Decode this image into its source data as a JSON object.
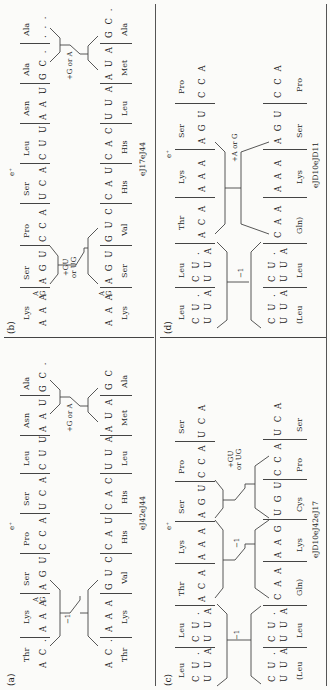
{
  "figure": {
    "panels": [
      {
        "id": "a",
        "label": "(a)",
        "e_plus": "e⁺",
        "strain": "eJ42eJ44",
        "wt_amino": [
          "Thr",
          "Lys",
          "Ser",
          "Pro",
          "Ser",
          "Leu",
          "Asn",
          "Ala"
        ],
        "wt_codons": [
          "A C .",
          "A A A/G",
          "A G U",
          "C C A",
          "U C A",
          "C U U",
          "A A U",
          "G C ."
        ],
        "mut_amino": [
          "Thr",
          "Lys",
          "Val",
          "His",
          "His",
          "Leu",
          "Met",
          "Ala"
        ],
        "mut_codons": [
          "A C .",
          "A A A",
          "G U C",
          "C A U",
          "C A C",
          "U U A",
          "A U A/G",
          "G C"
        ],
        "shift1": "−1",
        "shift2": "+G or A"
      },
      {
        "id": "b",
        "label": "(b)",
        "e_plus": "e⁺",
        "strain": "eJ17eJ44",
        "wt_amino": [
          "Lys",
          "Ser",
          "Pro",
          "Ser",
          "Leu",
          "Asn",
          "Ala",
          "Ala"
        ],
        "wt_codons": [
          "A A A/G",
          "A G U",
          "C C A",
          "U C A",
          "C U U",
          "A A U",
          "G C .",
          ". . ."
        ],
        "mut_amino": [
          "Lys",
          "Ser",
          "Val",
          "His",
          "His",
          "Leu",
          "Met",
          "Ala"
        ],
        "mut_codons": [
          "A A A/G",
          "A G U",
          "G U C",
          "C A U",
          "C A C",
          "U U A",
          "A U A/G",
          "G C ."
        ],
        "shift1": "+GU or UG",
        "shift2": "+G or A"
      },
      {
        "id": "c",
        "label": "(c)",
        "e_plus": "e⁺",
        "strain": "eJD10eJ42eJ17",
        "wt_amino": [
          "Leu",
          "Leu",
          "Thr",
          "Lys",
          "Ser",
          "Pro",
          "Ser"
        ],
        "wt_codons": [
          "C U .  U U A/G",
          "C U .  U U A/G",
          "A C A/G",
          "A A A/G",
          "A G U",
          "C C A",
          "U C A"
        ],
        "mut_amino": [
          "(Leu",
          "Leu",
          "Gln)",
          "Lys",
          "Cys",
          "Pro",
          "Ser"
        ],
        "mut_codons": [
          "C U .  U U A/G",
          "C U .  U U A/G",
          "C A A",
          "A A G",
          "U G U",
          "C C A",
          "U C A"
        ],
        "shift1": "−1",
        "shift2": "−1",
        "shift3": "+GU or UG"
      },
      {
        "id": "d",
        "label": "(d)",
        "e_plus": "e⁺",
        "strain": "eJD10eJD11",
        "wt_amino": [
          "Leu",
          "Leu",
          "Thr",
          "Lys",
          "Ser",
          "Pro"
        ],
        "wt_codons": [
          "C U .  U U A/G",
          "C U .  U U A/G",
          "A C A/G",
          "A A A/G",
          "A G U",
          "C C A"
        ],
        "mut_amino": [
          "(Leu",
          "Leu",
          "Gln)",
          "Lys",
          "Ser",
          "Pro"
        ],
        "mut_codons": [
          "C U .  U U A/G",
          "C U .  U U A/G",
          "C A A/G",
          "A A A/G",
          "A G U",
          "C C A"
        ],
        "shift1": "−1",
        "shift2": "+A or G"
      }
    ]
  },
  "a": {
    "label": "(a)",
    "eplus": "e⁺",
    "strain": "eJ42eJ44",
    "s1": "−1",
    "s2": "+G or A",
    "w": [
      "Thr",
      "Lys",
      "Ser",
      "Pro",
      "Ser",
      "Leu",
      "Asn",
      "Ala"
    ],
    "wc": [
      "A C .",
      "A A A",
      "A G U",
      "C C A",
      "U C A",
      "C U U",
      "A A U",
      "G C ."
    ],
    "m": [
      "Thr",
      "Lys",
      "Val",
      "His",
      "His",
      "Leu",
      "Met",
      "Ala"
    ],
    "mc": [
      "A C .",
      "A A A",
      "G U C",
      "C A U",
      "C A C",
      "U U A",
      "A U A",
      "G C"
    ],
    "wob_a": "A",
    "wob_g": "G"
  },
  "b": {
    "label": "(b)",
    "eplus": "e⁺",
    "strain": "eJ17eJ44",
    "s1a": "+GU",
    "s1b": "or UG",
    "s2": "+G or A",
    "w": [
      "Lys",
      "Ser",
      "Pro",
      "Ser",
      "Leu",
      "Asn",
      "Ala",
      "Ala"
    ],
    "wc": [
      "A A A",
      "A G U",
      "C C A",
      "U C A",
      "C U U",
      "A A U",
      "G C .",
      ". . ."
    ],
    "m": [
      "Lys",
      "Ser",
      "Val",
      "His",
      "His",
      "Leu",
      "Met",
      "Ala"
    ],
    "mc": [
      "A A A",
      "A G U",
      "G U C",
      "C A U",
      "C A C",
      "U U A",
      "A U A",
      "G C ."
    ]
  },
  "c": {
    "label": "(c)",
    "eplus": "e⁺",
    "strain": "eJD10eJ42eJ17",
    "s1": "−1",
    "s2": "−1",
    "s3a": "+GU",
    "s3b": "or UG",
    "w": [
      "Leu",
      "Leu",
      "Thr",
      "Lys",
      "Ser",
      "Pro",
      "Ser"
    ],
    "wc": [
      "C U .",
      "C U .",
      "A C A",
      "A A A",
      "A G U",
      "C C A",
      "U C A"
    ],
    "wc2": [
      "U U A",
      "U U A"
    ],
    "m": [
      "(Leu",
      "Leu",
      "Gln)",
      "Lys",
      "Cys",
      "Pro",
      "Ser"
    ],
    "mc": [
      "C U .",
      "C U .",
      "C A A",
      "A A G",
      "U G U",
      "C C A",
      "U C A"
    ],
    "mc2": [
      "U U A",
      "U U A"
    ]
  },
  "d": {
    "label": "(d)",
    "eplus": "e⁺",
    "strain": "eJD10eJD11",
    "s1": "−1",
    "s2": "+A or G",
    "w": [
      "Leu",
      "Leu",
      "Thr",
      "Lys",
      "Ser",
      "Pro"
    ],
    "wc": [
      "C U .",
      "C U .",
      "A C A",
      "A A A",
      "A G U",
      "C C A"
    ],
    "wc2": [
      "U U A",
      "U U A"
    ],
    "m": [
      "(Leu",
      "Leu",
      "Gln)",
      "Lys",
      "Ser",
      "Pro"
    ],
    "mc": [
      "C U .",
      "C U .",
      "C A A",
      "A A A",
      "A G U",
      "C C A"
    ],
    "mc2": [
      "U U A",
      "U U A"
    ]
  },
  "g": "G"
}
